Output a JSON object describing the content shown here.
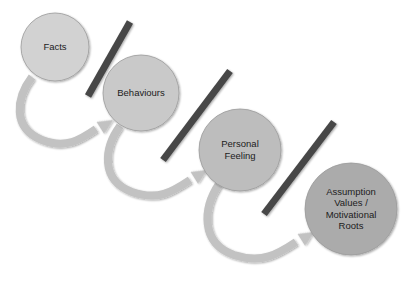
{
  "diagram": {
    "type": "process-flow",
    "background_color": "#ffffff",
    "arrow_color": "#c2c2c2",
    "arrow_edge_color": "#b3b3b3",
    "separator_color": "#474747",
    "label_color": "#1c1c1c",
    "nodes": [
      {
        "id": "facts",
        "label": "Facts",
        "lines": [
          "Facts"
        ],
        "cx": 55,
        "cy": 47,
        "r": 34,
        "fill": "#d2d2d2",
        "font_size": 9.5,
        "line_height": 11
      },
      {
        "id": "behaviours",
        "label": "Behaviours",
        "lines": [
          "Behaviours"
        ],
        "cx": 141,
        "cy": 93,
        "r": 38,
        "fill": "#c9c9c9",
        "font_size": 9.5,
        "line_height": 11
      },
      {
        "id": "personal-feeling",
        "label": "Personal Feeling",
        "lines": [
          "Personal",
          "Feeling"
        ],
        "cx": 240,
        "cy": 150,
        "r": 41,
        "fill": "#bdbdbd",
        "font_size": 9.5,
        "line_height": 11.5
      },
      {
        "id": "assumption-values-motivational-roots",
        "label": "Assumption Values / Motivational Roots",
        "lines": [
          "Assumption",
          "Values /",
          "Motivational",
          "Roots"
        ],
        "cx": 351,
        "cy": 209,
        "r": 46,
        "fill": "#ababab",
        "font_size": 9.5,
        "line_height": 11.5
      }
    ],
    "separators": [
      {
        "id": "separator-1",
        "x1": 130,
        "y1": 22,
        "x2": 88,
        "y2": 96,
        "width": 7
      },
      {
        "id": "separator-2",
        "x1": 230,
        "y1": 71,
        "x2": 163,
        "y2": 160,
        "width": 7
      },
      {
        "id": "separator-3",
        "x1": 334,
        "y1": 122,
        "x2": 264,
        "y2": 214,
        "width": 7
      }
    ],
    "arrows": [
      {
        "id": "arrow-facts-to-behaviours",
        "from": "facts",
        "to": "behaviours",
        "path": "M 32 77 C 16 98, 12 128, 42 140 C 66 149, 80 140, 96 129",
        "head": {
          "tipx": 113,
          "tipy": 120,
          "angle": -32
        },
        "width": 8
      },
      {
        "id": "arrow-behaviours-to-personal-feeling",
        "from": "behaviours",
        "to": "personal-feeling",
        "path": "M 120 126 C 104 148, 100 180, 132 192 C 158 201, 172 192, 190 180",
        "head": {
          "tipx": 207,
          "tipy": 170,
          "angle": -32
        },
        "width": 8
      },
      {
        "id": "arrow-personal-feeling-to-assumption",
        "from": "personal-feeling",
        "to": "assumption-values-motivational-roots",
        "path": "M 219 184 C 203 208, 200 243, 234 255 C 262 264, 278 254, 296 242",
        "head": {
          "tipx": 314,
          "tipy": 232,
          "angle": -32
        },
        "width": 8
      }
    ]
  }
}
